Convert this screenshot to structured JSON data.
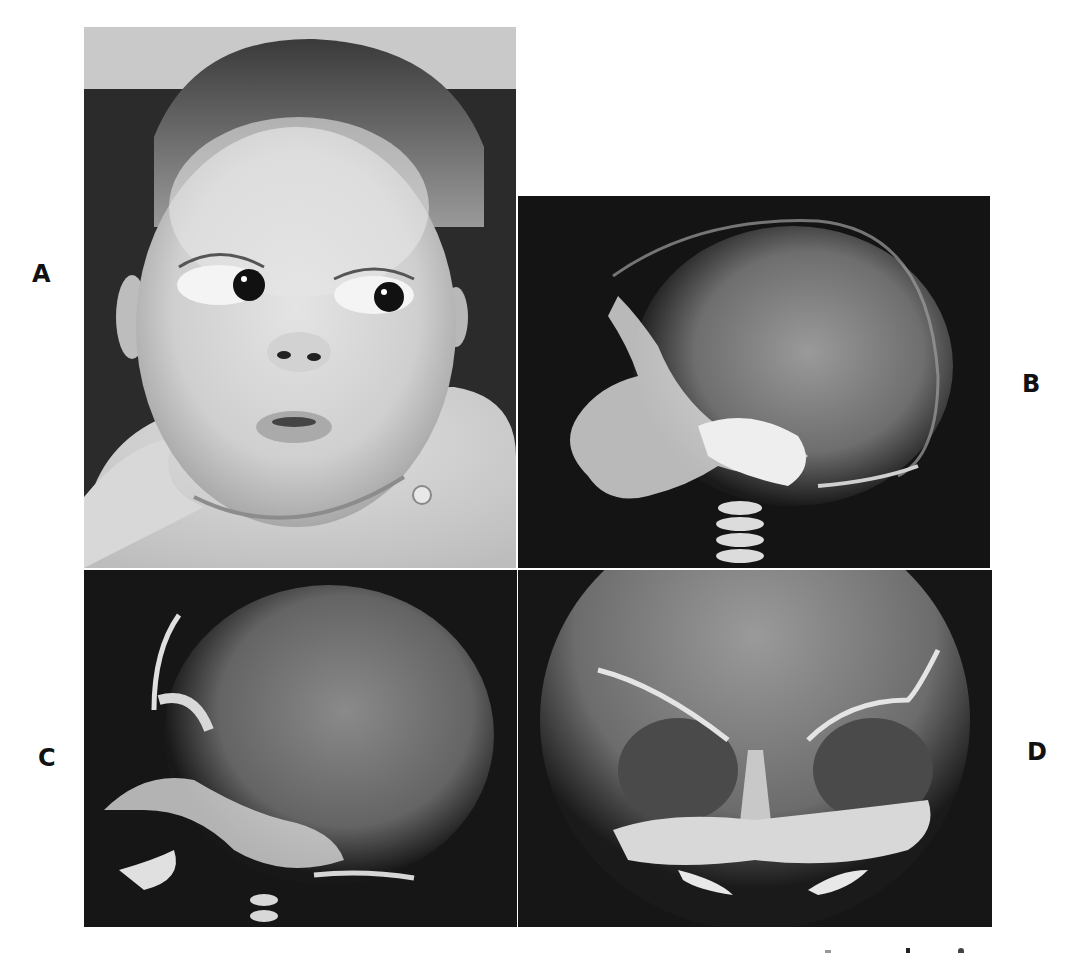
{
  "figure": {
    "panels": [
      {
        "id": "A",
        "label": "A",
        "content": "infant-photograph",
        "description": "Infant face photograph, black and white, looking to the side"
      },
      {
        "id": "B",
        "label": "B",
        "content": "lateral-skull-radiograph",
        "description": "Lateral skull X-ray of infant"
      },
      {
        "id": "C",
        "label": "C",
        "content": "lateral-skull-radiograph",
        "description": "Lateral skull X-ray of infant, second view"
      },
      {
        "id": "D",
        "label": "D",
        "content": "frontal-skull-radiograph",
        "description": "Frontal (AP) skull X-ray showing orbits"
      }
    ]
  },
  "colors": {
    "background": "#ffffff",
    "xray_dark": "#161616",
    "xray_bone": "#e8e8e8",
    "photo_bg_dark": "#2a2a2a",
    "photo_bg_light": "#c8c8c8",
    "skin": "#d6d6d6",
    "label": "#111111"
  }
}
